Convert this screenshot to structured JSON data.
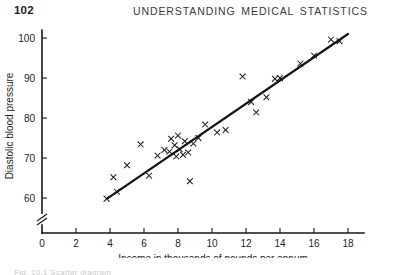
{
  "page": {
    "folio": "102",
    "running_head": "UNDERSTANDING MEDICAL STATISTICS",
    "bottom_stub": "Fig. 10.1  Scatter diagram"
  },
  "chart_data": {
    "type": "scatter",
    "title": "",
    "xlabel": "Income in thousands of pounds per annum",
    "ylabel": "Diastolic blood pressure",
    "xlim": [
      0,
      18.8
    ],
    "ylim": [
      56,
      103
    ],
    "grid": false,
    "legend": "none",
    "axis_break_y": true,
    "xticks": [
      0,
      2,
      4,
      6,
      8,
      10,
      12,
      14,
      16,
      18
    ],
    "xticklabels": [
      "0",
      "2",
      "4",
      "6",
      "8",
      "10",
      "12",
      "14",
      "16",
      "18"
    ],
    "yticks": [
      60,
      70,
      80,
      90,
      100
    ],
    "yticklabels": [
      "60",
      "70",
      "80",
      "90",
      "100"
    ],
    "marker": "x",
    "points": [
      {
        "x": 3.8,
        "y": 59.8
      },
      {
        "x": 4.2,
        "y": 65.2
      },
      {
        "x": 4.4,
        "y": 61.6
      },
      {
        "x": 5.0,
        "y": 68.2
      },
      {
        "x": 5.8,
        "y": 73.4
      },
      {
        "x": 6.3,
        "y": 65.6
      },
      {
        "x": 6.8,
        "y": 70.6
      },
      {
        "x": 7.2,
        "y": 72.0
      },
      {
        "x": 7.5,
        "y": 71.6
      },
      {
        "x": 7.6,
        "y": 74.8
      },
      {
        "x": 7.8,
        "y": 73.2
      },
      {
        "x": 7.9,
        "y": 70.4
      },
      {
        "x": 8.0,
        "y": 75.6
      },
      {
        "x": 8.1,
        "y": 72.2
      },
      {
        "x": 8.3,
        "y": 70.8
      },
      {
        "x": 8.4,
        "y": 74.2
      },
      {
        "x": 8.6,
        "y": 71.4
      },
      {
        "x": 8.7,
        "y": 64.2
      },
      {
        "x": 8.9,
        "y": 73.6
      },
      {
        "x": 9.2,
        "y": 75.0
      },
      {
        "x": 9.6,
        "y": 78.4
      },
      {
        "x": 10.3,
        "y": 76.4
      },
      {
        "x": 10.8,
        "y": 77.0
      },
      {
        "x": 11.8,
        "y": 90.4
      },
      {
        "x": 12.3,
        "y": 84.0
      },
      {
        "x": 12.6,
        "y": 81.4
      },
      {
        "x": 13.2,
        "y": 85.2
      },
      {
        "x": 13.7,
        "y": 89.8
      },
      {
        "x": 14.0,
        "y": 90.0
      },
      {
        "x": 15.2,
        "y": 93.6
      },
      {
        "x": 16.0,
        "y": 95.6
      },
      {
        "x": 17.0,
        "y": 99.6
      },
      {
        "x": 17.5,
        "y": 99.2
      }
    ],
    "fit_line": {
      "x_start": 3.85,
      "y_start": 59.9,
      "x_end": 18.0,
      "y_end": 101.0
    }
  }
}
